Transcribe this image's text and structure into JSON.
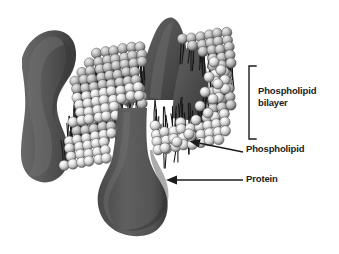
{
  "figure": {
    "kind": "cell-membrane-fluid-mosaic-diagram",
    "background_color": "#ffffff",
    "width": 339,
    "height": 254
  },
  "labels": {
    "bilayer": "Phospholipid\nbilayer",
    "phospholipid": "Phospholipid",
    "protein": "Protein"
  },
  "annotations": {
    "bracket": {
      "name": "bilayer-bracket",
      "orientation": "opens-right",
      "x": 249,
      "y_top": 66,
      "y_bottom": 139,
      "tick_length": 7,
      "color": "#1c1c1c",
      "stroke_width": 1.4
    },
    "arrows": [
      {
        "name": "phospholipid-arrow",
        "label": "Phospholipid",
        "from_x": 243,
        "from_y": 152,
        "to_x": 189,
        "to_y": 141,
        "color": "#1c1c1c"
      },
      {
        "name": "protein-arrow",
        "label": "Protein",
        "from_x": 243,
        "from_y": 180,
        "to_x": 166,
        "to_y": 180,
        "color": "#1c1c1c"
      }
    ]
  },
  "colors": {
    "background": "#ffffff",
    "protein_dark": "#5a5a5a",
    "protein_mid": "#6e6e6e",
    "protein_shadow": "#3f3f3f",
    "protein_highlight": "#8a8a8a",
    "head_light": "#f2f2f2",
    "head_mid": "#c9c9c9",
    "head_dark": "#7d7d7d",
    "tail_color": "#151515",
    "text": "#1c1c1c"
  },
  "structures": {
    "membrane": {
      "name": "phospholipid-bilayer",
      "description": "Two opposed sheets of spherical phospholipid heads with hydrophobic tails between them, drawn in 3/4 perspective",
      "head_count_visible": 310,
      "head_radius_px": 5.2,
      "layers": [
        "outer leaflet",
        "inner leaflet"
      ]
    },
    "proteins": [
      {
        "name": "protein-left",
        "description": "Large integral protein spanning the membrane at the left edge, column shaped with a waist",
        "cx": 42,
        "cy": 110
      },
      {
        "name": "protein-center",
        "description": "Integral protein with a narrow neck widening into a bulbous intracellular domain",
        "cx": 132,
        "cy": 190
      },
      {
        "name": "protein-top",
        "description": "Integral protein projecting above the membrane surface toward the upper right",
        "cx": 160,
        "cy": 40
      },
      {
        "name": "protein-right",
        "description": "Integral protein embedded in the right portion of the membrane",
        "cx": 185,
        "cy": 60
      }
    ]
  }
}
